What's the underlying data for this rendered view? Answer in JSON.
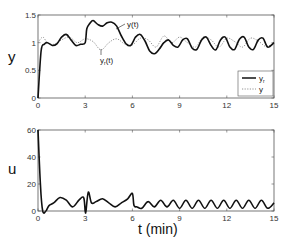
{
  "chart_data": [
    {
      "type": "line",
      "title": "",
      "xlabel": "",
      "ylabel": "y",
      "xlim": [
        0,
        15
      ],
      "ylim": [
        0,
        1.5
      ],
      "xticks": [
        0,
        3,
        6,
        9,
        12,
        15
      ],
      "yticks": [
        0,
        0.5,
        1,
        1.5
      ],
      "xtick_labels": [
        "0",
        "3",
        "6",
        "9",
        "12",
        "15"
      ],
      "ytick_labels": [
        "0",
        "0.5",
        "1",
        "1.5"
      ],
      "grid": false,
      "legend_position": "lower right",
      "legend": [
        {
          "label": "y",
          "sub": "r",
          "style": "solid"
        },
        {
          "label": "y",
          "sub": "",
          "style": "dotted"
        }
      ],
      "annotations": [
        {
          "text": "y(t)",
          "x": 4.9,
          "y": 1.38
        },
        {
          "text": "y_r(t)",
          "x": 4.2,
          "y": 0.88
        }
      ],
      "series": [
        {
          "name": "y(t)",
          "style": "solid",
          "x": [
            0,
            0.2,
            0.4,
            0.6,
            0.9,
            1.2,
            1.5,
            1.8,
            2.1,
            2.4,
            2.7,
            3.0,
            3.1,
            3.3,
            3.5,
            3.8,
            4.1,
            4.4,
            4.7,
            5.0,
            5.3,
            5.6,
            5.9,
            6.2,
            6.5,
            6.8,
            7.1,
            7.4,
            7.7,
            8.0,
            8.3,
            8.6,
            8.9,
            9.2,
            9.5,
            9.8,
            10.1,
            10.4,
            10.7,
            11.0,
            11.3,
            11.6,
            11.9,
            12.2,
            12.5,
            12.8,
            13.1,
            13.4,
            13.7,
            14.0,
            14.3,
            14.6,
            15.0
          ],
          "y": [
            0,
            0.85,
            0.97,
            1.0,
            0.95,
            0.98,
            1.1,
            1.15,
            1.05,
            0.95,
            0.97,
            1.0,
            1.25,
            1.35,
            1.4,
            1.33,
            1.3,
            1.36,
            1.37,
            1.3,
            1.12,
            0.98,
            0.95,
            1.1,
            1.15,
            1.03,
            0.85,
            0.8,
            0.88,
            1.0,
            1.05,
            0.95,
            0.92,
            1.05,
            1.07,
            0.9,
            0.88,
            1.05,
            1.1,
            0.95,
            0.87,
            1.05,
            1.1,
            0.92,
            0.88,
            1.06,
            1.1,
            0.92,
            0.88,
            1.05,
            1.08,
            0.92,
            1.0
          ]
        },
        {
          "name": "y_r(t)",
          "style": "dotted",
          "x": [
            0,
            0.3,
            0.6,
            1.0,
            1.5,
            2.0,
            2.5,
            3.0,
            3.5,
            4.0,
            4.5,
            5.0,
            5.5,
            6.0,
            6.5,
            7.0,
            7.5,
            8.0,
            8.5,
            9.0,
            9.5,
            10.0,
            10.5,
            11.0,
            11.5,
            12.0,
            12.5,
            13.0,
            13.5,
            14.0,
            14.5,
            15.0
          ],
          "y": [
            1.0,
            1.1,
            1.0,
            0.97,
            1.05,
            1.1,
            1.0,
            1.07,
            1.02,
            0.87,
            1.0,
            1.07,
            0.98,
            0.96,
            1.08,
            1.05,
            0.92,
            1.12,
            1.0,
            1.1,
            1.0,
            0.92,
            1.1,
            1.05,
            0.92,
            1.08,
            1.02,
            0.92,
            1.08,
            1.03,
            0.93,
            1.0
          ]
        }
      ]
    },
    {
      "type": "line",
      "title": "",
      "xlabel": "t (min)",
      "ylabel": "u",
      "xlim": [
        0,
        15
      ],
      "ylim": [
        0,
        60
      ],
      "xticks": [
        0,
        3,
        6,
        9,
        12,
        15
      ],
      "yticks": [
        0,
        20,
        40,
        60
      ],
      "xtick_labels": [
        "0",
        "3",
        "6",
        "9",
        "12",
        "15"
      ],
      "ytick_labels": [
        "0",
        "20",
        "40",
        "60"
      ],
      "grid": false,
      "series": [
        {
          "name": "u(t)",
          "style": "solid",
          "x": [
            0,
            0.15,
            0.3,
            0.5,
            0.7,
            1.0,
            1.4,
            1.8,
            2.2,
            2.6,
            2.9,
            3.0,
            3.05,
            3.2,
            3.4,
            3.7,
            4.1,
            4.5,
            4.9,
            5.3,
            5.7,
            6.0,
            6.1,
            6.3,
            6.6,
            7.0,
            7.4,
            7.8,
            8.2,
            8.6,
            9.0,
            9.4,
            9.8,
            10.2,
            10.6,
            11.0,
            11.4,
            11.8,
            12.2,
            12.6,
            13.0,
            13.4,
            13.8,
            14.2,
            14.6,
            15.0
          ],
          "y": [
            60,
            20,
            0,
            0,
            4,
            6,
            10,
            8,
            3,
            8,
            10,
            0,
            0,
            14,
            6,
            7,
            9,
            6,
            3,
            6,
            9,
            13,
            4,
            3,
            2,
            7,
            3,
            8,
            3,
            8,
            2,
            8,
            2,
            8,
            2,
            8,
            2,
            8,
            2,
            8,
            2,
            8,
            2,
            8,
            2,
            6
          ]
        }
      ]
    }
  ],
  "labels": {
    "top_ylabel": "y",
    "bottom_ylabel": "u",
    "xlabel": "t (min)",
    "ann_y": "y(t)",
    "ann_yr_main": "y",
    "ann_yr_sub": "r",
    "ann_yr_tail": "(t)",
    "legend_1_main": "y",
    "legend_1_sub": "r",
    "legend_2_main": "y"
  }
}
